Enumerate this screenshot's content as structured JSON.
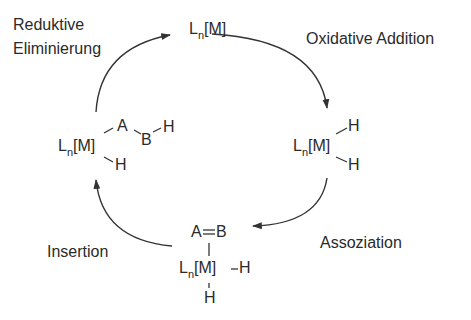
{
  "diagram": {
    "type": "catalytic-cycle",
    "steps": [
      {
        "id": "oxidative_addition",
        "label": "Oxidative Addition"
      },
      {
        "id": "association",
        "label": "Assoziation"
      },
      {
        "id": "insertion",
        "label": "Insertion"
      },
      {
        "id": "reductive_elimination",
        "label_line1": "Reduktive",
        "label_line2": "Eliminierung"
      }
    ],
    "species": {
      "top": {
        "L": "L",
        "n": "n",
        "M": "[M]"
      },
      "right": {
        "L": "L",
        "n": "n",
        "M": "[M]",
        "H1": "H",
        "H2": "H"
      },
      "bottom": {
        "A": "A",
        "double_bond": "=",
        "B": "B",
        "L": "L",
        "n": "n",
        "M": "[M]",
        "H_right": "H",
        "H_bottom": "H"
      },
      "left": {
        "L": "L",
        "n": "n",
        "M": "[M]",
        "A": "A",
        "B": "B",
        "H_on_B": "H",
        "H_on_M": "H"
      }
    },
    "arrow_color": "#333333",
    "direction": "clockwise"
  }
}
